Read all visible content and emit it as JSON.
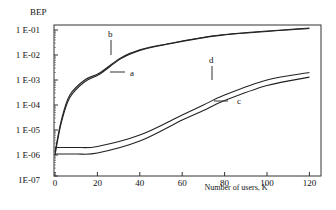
{
  "chart_data": {
    "type": "line",
    "title": "",
    "xlabel": "Number of users, K",
    "ylabel": "BEP",
    "xlim": [
      0,
      120
    ],
    "ylim": [
      1e-07,
      0.1
    ],
    "yscale": "log",
    "grid": false,
    "legend": "inline curve labels a, b, c, d",
    "x_ticks": [
      0,
      20,
      40,
      60,
      80,
      100,
      120
    ],
    "x_tick_labels": [
      "0",
      "20",
      "40",
      "60",
      "80",
      "100",
      "120"
    ],
    "y_ticks": [
      0.1,
      0.01,
      0.001,
      0.0001,
      1e-05,
      1e-06,
      1e-07
    ],
    "y_tick_labels": [
      "1 E-01",
      "1 E-02",
      "1 E-03",
      "1 E-04",
      "1 E-05",
      "1 E-06",
      "1E-07"
    ],
    "series": [
      {
        "name": "a",
        "x": [
          0,
          3,
          7,
          14,
          21,
          31,
          40,
          50,
          78,
          120
        ],
        "values": [
          1e-06,
          2e-05,
          0.0002,
          0.00085,
          0.0017,
          0.007,
          0.015,
          0.024,
          0.061,
          0.115
        ]
      },
      {
        "name": "b",
        "x": [
          0,
          3,
          7,
          14,
          21,
          31,
          40,
          50,
          78,
          120
        ],
        "values": [
          1.3e-06,
          2.5e-05,
          0.00025,
          0.001,
          0.0019,
          0.0076,
          0.016,
          0.025,
          0.063,
          0.12
        ]
      },
      {
        "name": "c",
        "x": [
          0,
          10,
          20,
          40,
          60,
          70,
          80,
          100,
          120
        ],
        "values": [
          1.1e-06,
          1.1e-06,
          1.2e-06,
          3.6e-06,
          2.5e-05,
          6e-05,
          0.00015,
          0.0006,
          0.0013
        ]
      },
      {
        "name": "d",
        "x": [
          0,
          10,
          20,
          40,
          60,
          70,
          80,
          100,
          120
        ],
        "values": [
          2e-06,
          2e-06,
          2.2e-06,
          6.3e-06,
          4e-05,
          0.0001,
          0.00025,
          0.001,
          0.002
        ]
      }
    ],
    "annotations": [
      {
        "label": "a",
        "near_x": 25,
        "near_y": 0.0015
      },
      {
        "label": "b",
        "near_x": 26,
        "near_y": 0.025
      },
      {
        "label": "c",
        "near_x": 85,
        "near_y": 1.6e-05
      },
      {
        "label": "d",
        "near_x": 74,
        "near_y": 0.013
      }
    ]
  },
  "labels": {
    "ylabel": "BEP",
    "xlabel": "Number of users, K",
    "curve_a": "a",
    "curve_b": "b",
    "curve_c": "c",
    "curve_d": "d"
  }
}
